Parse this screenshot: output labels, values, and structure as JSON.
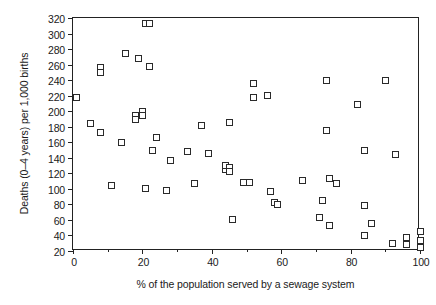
{
  "chart_data": {
    "type": "scatter",
    "title": "",
    "xlabel": "% of the population served by a sewage system",
    "ylabel": "Deaths (0–4 years) per 1,000 births",
    "xlim": [
      0,
      100
    ],
    "ylim": [
      20,
      320
    ],
    "xticks": [
      0,
      20,
      40,
      60,
      80,
      100
    ],
    "xtick_labels": [
      "0",
      "20",
      "40",
      "60",
      "80",
      "100"
    ],
    "x_minor_ticks": [
      10,
      30,
      50,
      70,
      90
    ],
    "yticks": [
      20,
      40,
      60,
      80,
      100,
      120,
      140,
      160,
      180,
      200,
      220,
      240,
      260,
      280,
      300,
      320
    ],
    "ytick_labels": [
      "20",
      "40",
      "60",
      "80",
      "100",
      "120",
      "140",
      "160",
      "180",
      "200",
      "220",
      "240",
      "260",
      "280",
      "300",
      "320"
    ],
    "grid": false,
    "legend": null,
    "marker": "open-square",
    "marker_color": "#2a2a2a",
    "points": [
      [
        1,
        218
      ],
      [
        5,
        184
      ],
      [
        8,
        172
      ],
      [
        8,
        256
      ],
      [
        8,
        250
      ],
      [
        11,
        104
      ],
      [
        14,
        160
      ],
      [
        15,
        274
      ],
      [
        18,
        195
      ],
      [
        18,
        189
      ],
      [
        19,
        268
      ],
      [
        20,
        200
      ],
      [
        20,
        194
      ],
      [
        21,
        100
      ],
      [
        21,
        313
      ],
      [
        22,
        313
      ],
      [
        22,
        258
      ],
      [
        23,
        150
      ],
      [
        24,
        166
      ],
      [
        27,
        98
      ],
      [
        28,
        137
      ],
      [
        33,
        148
      ],
      [
        35,
        107
      ],
      [
        37,
        182
      ],
      [
        39,
        145
      ],
      [
        44,
        125
      ],
      [
        44,
        130
      ],
      [
        45,
        128
      ],
      [
        45,
        122
      ],
      [
        45,
        186
      ],
      [
        46,
        60
      ],
      [
        49,
        108
      ],
      [
        51,
        108
      ],
      [
        52,
        236
      ],
      [
        52,
        218
      ],
      [
        56,
        220
      ],
      [
        57,
        96
      ],
      [
        58,
        82
      ],
      [
        59,
        80
      ],
      [
        66,
        111
      ],
      [
        71,
        63
      ],
      [
        72,
        85
      ],
      [
        73,
        175
      ],
      [
        73,
        240
      ],
      [
        74,
        113
      ],
      [
        74,
        53
      ],
      [
        76,
        107
      ],
      [
        82,
        208
      ],
      [
        84,
        149
      ],
      [
        84,
        78
      ],
      [
        84,
        40
      ],
      [
        86,
        56
      ],
      [
        90,
        240
      ],
      [
        92,
        30
      ],
      [
        93,
        144
      ],
      [
        96,
        37
      ],
      [
        96,
        29
      ],
      [
        100,
        45
      ],
      [
        100,
        33
      ],
      [
        100,
        25
      ]
    ]
  },
  "axis": {
    "frame_color": "#222222",
    "marker_edge_color": "#2a2a2a",
    "background": "#ffffff"
  }
}
